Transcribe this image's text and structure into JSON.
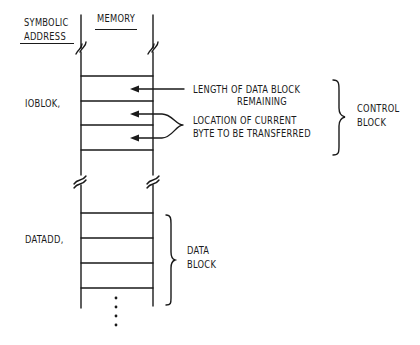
{
  "headers": {
    "symbolic_address_line1": "SYMBOLIC",
    "symbolic_address_line2": "ADDRESS",
    "memory": "MEMORY"
  },
  "addresses": {
    "ioblok": "IOBLOK,",
    "datadd": "DATADD,"
  },
  "annotations": {
    "length_line1": "LENGTH OF DATA BLOCK",
    "length_line2": "REMAINING",
    "location_line1": "LOCATION OF CURRENT",
    "location_line2": "BYTE TO BE TRANSFERRED"
  },
  "braces": {
    "control_line1": "CONTROL",
    "control_line2": "BLOCK",
    "data_line1": "DATA",
    "data_line2": "BLOCK"
  },
  "colors": {
    "ink": "#1a1a1a",
    "background": "#ffffff"
  }
}
